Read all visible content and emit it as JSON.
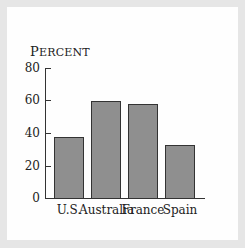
{
  "chart_data": {
    "type": "bar",
    "title": "",
    "ylabel": "Percent",
    "xlabel": "",
    "categories": [
      "U.S.",
      "Australia",
      "France",
      "Spain"
    ],
    "values": [
      38,
      60,
      58,
      33
    ],
    "ylim": [
      0,
      80
    ],
    "yticks": [
      "0",
      "20",
      "40",
      "60",
      "80"
    ],
    "grid": false,
    "legend": null,
    "bar_color": "#8f8f8f"
  },
  "ylabel_first": "P",
  "ylabel_rest": "ERCENT"
}
